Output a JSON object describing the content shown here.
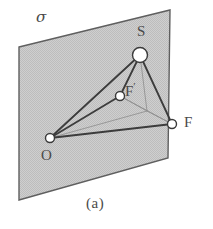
{
  "figure": {
    "caption": "(a)",
    "plane": {
      "name": "sigma",
      "label": "σ",
      "fill_color": "#c9c9c9",
      "edge_color": "#5f5f5f",
      "corners": [
        {
          "x": 19,
          "y": 47
        },
        {
          "x": 170,
          "y": 10
        },
        {
          "x": 168,
          "y": 158
        },
        {
          "x": 19,
          "y": 200
        }
      ]
    },
    "vertices": [
      {
        "id": "O",
        "label": "O",
        "x": 50,
        "y": 138,
        "r": 4.5,
        "fill": "#ffffff",
        "stroke": "#3a3a3a"
      },
      {
        "id": "S",
        "label": "S",
        "x": 140,
        "y": 55,
        "r": 7.5,
        "fill": "#ffffff",
        "stroke": "#3a3a3a"
      },
      {
        "id": "Fp",
        "label": "F",
        "prime": "′",
        "x": 120,
        "y": 96,
        "r": 4.5,
        "fill": "#ffffff",
        "stroke": "#3a3a3a"
      },
      {
        "id": "F",
        "label": "F",
        "x": 172,
        "y": 124,
        "r": 4.5,
        "fill": "#ffffff",
        "stroke": "#3a3a3a"
      },
      {
        "id": "H",
        "label": "",
        "x": 147,
        "y": 111,
        "r": 0,
        "fill": "none",
        "stroke": "none"
      }
    ],
    "solid_edges": [
      {
        "from": "O",
        "to": "S"
      },
      {
        "from": "O",
        "to": "F"
      },
      {
        "from": "S",
        "to": "F"
      },
      {
        "from": "O",
        "to": "Fp"
      },
      {
        "from": "S",
        "to": "Fp"
      }
    ],
    "faint_edges": [
      {
        "from": "Fp",
        "to": "F"
      },
      {
        "from": "O",
        "to": "H"
      },
      {
        "from": "S",
        "to": "H"
      },
      {
        "from": "H",
        "to": "F"
      },
      {
        "from": "Fp",
        "to": "H"
      }
    ],
    "stroke_colors": {
      "solid": "#3c3c3c",
      "faint": "#8c8c8c"
    },
    "stroke_widths": {
      "solid": 1.8,
      "faint": 0.8,
      "plane": 1.4
    }
  }
}
